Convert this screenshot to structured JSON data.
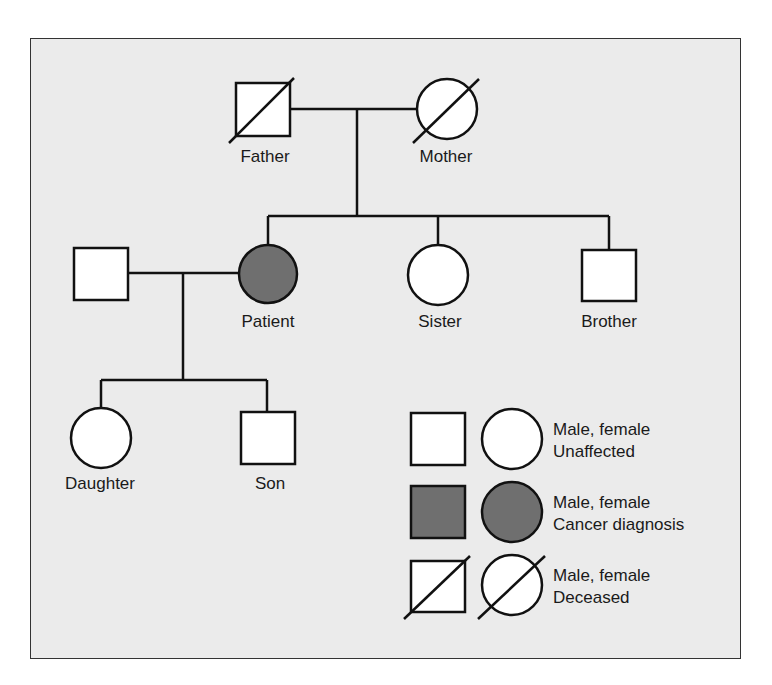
{
  "diagram": {
    "type": "pedigree",
    "colors": {
      "background": "#ebebeb",
      "affected": "#6f6f6f",
      "unaffected": "#ffffff",
      "line": "#111111"
    },
    "individuals": {
      "father": {
        "label": "Father",
        "sex": "male",
        "status": "deceased"
      },
      "mother": {
        "label": "Mother",
        "sex": "female",
        "status": "deceased"
      },
      "spouse": {
        "label": "",
        "sex": "male",
        "status": "unaffected"
      },
      "patient": {
        "label": "Patient",
        "sex": "female",
        "status": "cancer diagnosis"
      },
      "sister": {
        "label": "Sister",
        "sex": "female",
        "status": "unaffected"
      },
      "brother": {
        "label": "Brother",
        "sex": "male",
        "status": "unaffected"
      },
      "daughter": {
        "label": "Daughter",
        "sex": "female",
        "status": "unaffected"
      },
      "son": {
        "label": "Son",
        "sex": "male",
        "status": "unaffected"
      }
    },
    "legend": [
      {
        "line1": "Male, female",
        "line2": "Unaffected"
      },
      {
        "line1": "Male, female",
        "line2": "Cancer diagnosis"
      },
      {
        "line1": "Male, female",
        "line2": "Deceased"
      }
    ]
  }
}
